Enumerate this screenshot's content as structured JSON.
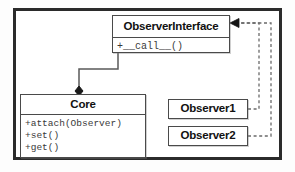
{
  "diagram": {
    "kind": "uml-class-diagram",
    "pattern_name": "Observer Pattern",
    "colors": {
      "frame": "#2b2b2b",
      "box_border": "#4a4a4a",
      "box_fill": "#ffffff",
      "title_text": "#111111",
      "member_text": "#3a3a3a",
      "connector": "#5a5a5a",
      "page_background": "#ffffff"
    }
  },
  "classes": {
    "observer_interface": {
      "name": "ObserverInterface",
      "stereotype": "",
      "members": [
        "+__call__()"
      ]
    },
    "core": {
      "name": "Core",
      "stereotype": "",
      "members": [
        "+attach(Observer)",
        "+set()",
        "+get()"
      ]
    },
    "observer1": {
      "name": "Observer1",
      "members": []
    },
    "observer2": {
      "name": "Observer2",
      "members": []
    }
  },
  "relationships": [
    {
      "id": "composition-interface-core",
      "type": "composition",
      "line_style": "solid",
      "source": "ObserverInterface",
      "target": "Core",
      "decoration": "filled-diamond-at-target",
      "label": ""
    },
    {
      "id": "realization-observer1-interface",
      "type": "realization",
      "line_style": "dashed",
      "source": "Observer1",
      "target": "ObserverInterface",
      "decoration": "arrowhead-at-target",
      "label": ""
    },
    {
      "id": "realization-observer2-interface",
      "type": "realization",
      "line_style": "dashed",
      "source": "Observer2",
      "target": "ObserverInterface",
      "decoration": "arrowhead-at-target",
      "label": ""
    }
  ]
}
